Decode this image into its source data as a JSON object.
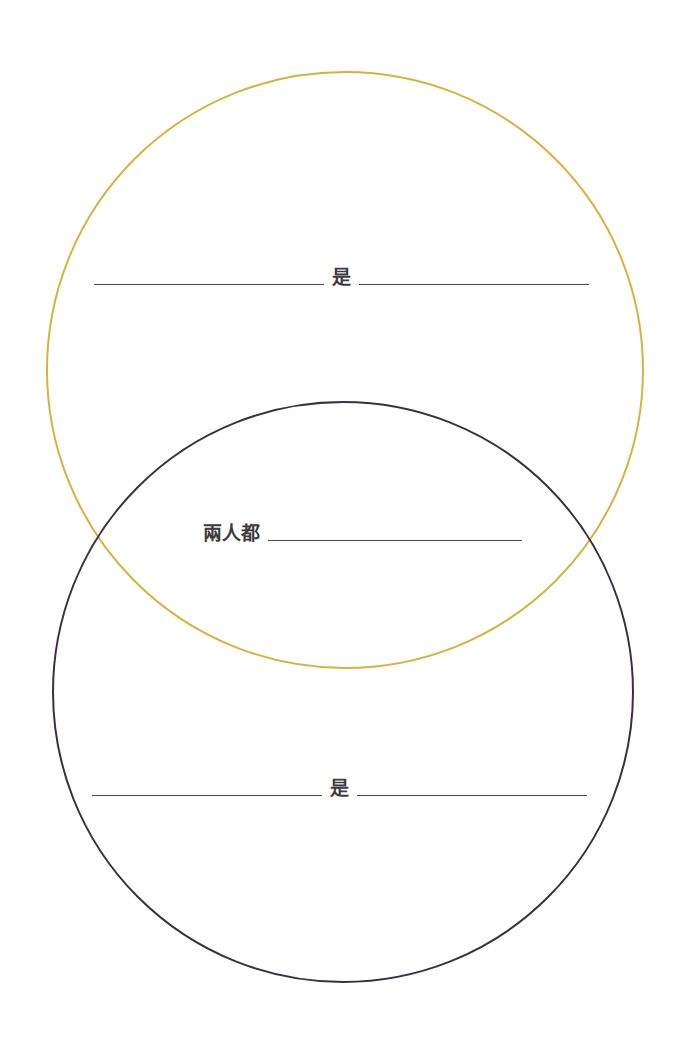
{
  "diagram": {
    "type": "venn",
    "circles": [
      {
        "name": "top-circle",
        "color": "#d4b43c",
        "cx": 345,
        "cy": 370,
        "r": 298
      },
      {
        "name": "bottom-circle",
        "color": "#3b3040",
        "cx": 343,
        "cy": 692,
        "r": 299
      }
    ],
    "top_circle": {
      "connector": "是",
      "blank_left": "",
      "blank_right": ""
    },
    "overlap": {
      "label": "兩人都",
      "blank": ""
    },
    "bottom_circle": {
      "connector": "是",
      "blank_left": "",
      "blank_right": ""
    }
  }
}
